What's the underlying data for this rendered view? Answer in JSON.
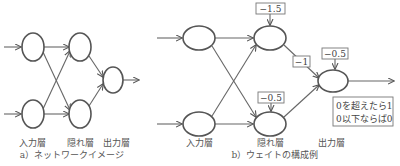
{
  "diagram_a": {
    "caption": "a）ネットワークイメージ",
    "layers": {
      "input": "入力層",
      "hidden": "隠れ層",
      "output": "出力層"
    }
  },
  "diagram_b": {
    "caption": "b）ウェイトの構成例",
    "layers": {
      "input": "入力層",
      "hidden": "隠れ層",
      "output": "出力層"
    },
    "weights": {
      "hidden_top_bias": "−1.5",
      "hidden_bottom_bias": "−0.5",
      "hidden_top_to_output": "−1",
      "output_bias": "−0.5"
    },
    "activation_rule": {
      "line1": "0を超えたら1",
      "line2": "0以下ならば0"
    }
  },
  "colors": {
    "stroke": "#555555",
    "text": "#555555",
    "background": "#ffffff"
  }
}
